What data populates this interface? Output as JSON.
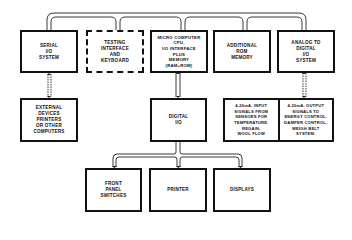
{
  "diagram": {
    "top_row": [
      {
        "id": "serial",
        "label": "SERIAL\nI/O\nSYSTEM",
        "style": "solid"
      },
      {
        "id": "testing",
        "label": "TESTING\nINTERFACE\nAND\nKEYBOARD",
        "style": "dashed"
      },
      {
        "id": "micro",
        "label": "MICRO COMPUTER\nCPU,\nI/O INTERFACE\nPLUS\nMEMORY\n(RAM+ROM)",
        "style": "solid"
      },
      {
        "id": "rom",
        "label": "ADDITIONAL\nROM\nMEMORY",
        "style": "solid"
      },
      {
        "id": "analog",
        "label": "ANALOG TO\nDIGITAL\nI/O\nSYSTEM",
        "style": "solid"
      }
    ],
    "middle_row": {
      "external": {
        "label": "EXTERNAL\nDEVICES\nPRINTERS\nOR OTHER\nCOMPUTERS"
      },
      "digital": {
        "label": "DIGITAL\nI/O"
      },
      "input_signals": {
        "label": "4-20mA. INPUT\nSIGNALS FROM\nSENSORS FOR\nTEMPERATURE,\nREGAIN,\nWOOL FLOW"
      },
      "output_signals": {
        "label": "4-20mA. OUTPUT\nSIGNALS TO\nENERGY CONTROL,\nDAMPER CONTROL,\nWEIGH BELT\nSYSTEM."
      }
    },
    "bottom_row": [
      {
        "id": "front_panel",
        "label": "FRONT\nPANEL\nSWITCHES"
      },
      {
        "id": "printer",
        "label": "PRINTER"
      },
      {
        "id": "displays",
        "label": "DISPLAYS"
      }
    ],
    "colors": {
      "line": "#111111",
      "background": "#ffffff"
    }
  }
}
